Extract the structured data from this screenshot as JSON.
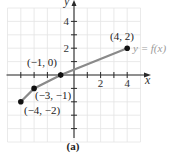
{
  "chart_data": {
    "type": "line",
    "title": "",
    "caption": "(a)",
    "xlabel": "x",
    "ylabel": "y",
    "function_label": "y = f(x)",
    "xlim": [
      -5,
      5
    ],
    "ylim": [
      -5,
      5
    ],
    "grid": true,
    "x_ticks": [
      {
        "value": 2,
        "label": "2"
      },
      {
        "value": 4,
        "label": "4"
      }
    ],
    "y_ticks": [
      {
        "value": 2,
        "label": "2"
      },
      {
        "value": 4,
        "label": "4"
      }
    ],
    "series": [
      {
        "name": "y = f(x)",
        "points": [
          {
            "x": -4,
            "y": -2,
            "label": "(−4, −2)"
          },
          {
            "x": -3,
            "y": -1,
            "label": "(−3, −1)"
          },
          {
            "x": -1,
            "y": 0,
            "label": "(−1, 0)"
          },
          {
            "x": 4,
            "y": 2,
            "label": "(4, 2)"
          }
        ]
      }
    ],
    "colors": {
      "curve": "#8a8a8a",
      "points": "#111111",
      "grid": "#e4e4e4",
      "axes": "#2a2a2a",
      "function_label": "#9a9a9a"
    }
  }
}
